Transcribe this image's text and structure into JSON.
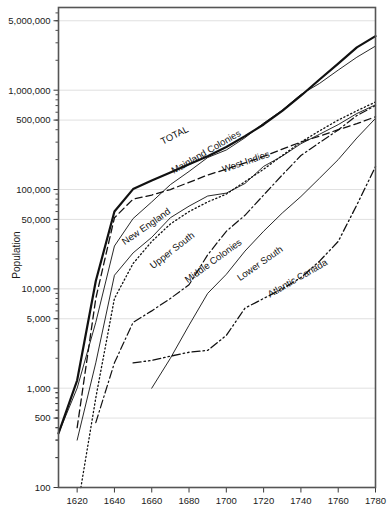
{
  "chart_data": {
    "type": "line",
    "title": "",
    "xlabel": "",
    "ylabel": "Population",
    "yscale": "log",
    "ylim": [
      100,
      6800000
    ],
    "xlim": [
      1610,
      1780
    ],
    "grid": true,
    "legend_position": "inline-labels",
    "y_tick_labels": [
      "5,000,000",
      "1,000,000",
      "500,000",
      "100,000",
      "50,000",
      "10,000",
      "5,000",
      "1,000",
      "500",
      "100"
    ],
    "y_tick_values": [
      5000000,
      1000000,
      500000,
      100000,
      50000,
      10000,
      5000,
      1000,
      500,
      100
    ],
    "x_tick_labels": [
      "1620",
      "1640",
      "1660",
      "1680",
      "1700",
      "1720",
      "1740",
      "1760",
      "1780"
    ],
    "x_tick_values": [
      1620,
      1640,
      1660,
      1680,
      1700,
      1720,
      1740,
      1760,
      1780
    ],
    "series": [
      {
        "name": "TOTAL",
        "style": "solid-thick",
        "label": "TOTAL",
        "label_x": 1673,
        "label_y": 330000,
        "label_rotate": -27,
        "x": [
          1610,
          1620,
          1630,
          1640,
          1650,
          1660,
          1670,
          1680,
          1690,
          1700,
          1710,
          1720,
          1730,
          1740,
          1750,
          1760,
          1770,
          1780
        ],
        "y": [
          350,
          1200,
          12000,
          60000,
          101000,
          123000,
          148000,
          180000,
          216000,
          268000,
          345000,
          452000,
          620000,
          880000,
          1280000,
          1850000,
          2700000,
          3500000
        ]
      },
      {
        "name": "Mainland Colonies",
        "style": "solid-thin",
        "label": "Mainland Colonies",
        "label_x": 1690,
        "label_y": 225000,
        "label_rotate": -30,
        "x": [
          1610,
          1620,
          1630,
          1640,
          1650,
          1660,
          1670,
          1680,
          1690,
          1700,
          1710,
          1720,
          1730,
          1740,
          1750,
          1760,
          1770,
          1780
        ],
        "y": [
          350,
          1000,
          4600,
          27000,
          51000,
          75000,
          112000,
          152000,
          210000,
          250000,
          332000,
          466000,
          629000,
          906000,
          1170000,
          1594000,
          2148000,
          2780000
        ]
      },
      {
        "name": "West Indies",
        "style": "dashed",
        "label": "West Indies",
        "label_x": 1711,
        "label_y": 178000,
        "label_rotate": -19,
        "x": [
          1620,
          1630,
          1640,
          1650,
          1660,
          1670,
          1680,
          1690,
          1700,
          1710,
          1720,
          1730,
          1740,
          1750,
          1760,
          1770,
          1780
        ],
        "y": [
          400,
          8000,
          52000,
          80000,
          88000,
          100000,
          118000,
          140000,
          160000,
          185000,
          215000,
          255000,
          300000,
          345000,
          400000,
          460000,
          540000
        ]
      },
      {
        "name": "New England",
        "style": "solid-thin",
        "label": "New England",
        "label_x": 1658,
        "label_y": 40000,
        "label_rotate": -35,
        "x": [
          1620,
          1630,
          1640,
          1650,
          1660,
          1670,
          1680,
          1690,
          1700,
          1710,
          1720,
          1730,
          1740,
          1750,
          1760,
          1770,
          1780
        ],
        "y": [
          300,
          1800,
          13700,
          23000,
          33000,
          52000,
          68000,
          86000,
          92000,
          115000,
          171000,
          217000,
          289000,
          360000,
          450000,
          582000,
          712000
        ]
      },
      {
        "name": "Upper South",
        "style": "dotted",
        "label": "Upper South",
        "label_x": 1672,
        "label_y": 23000,
        "label_rotate": -38,
        "x": [
          1622,
          1630,
          1640,
          1650,
          1660,
          1670,
          1680,
          1690,
          1700,
          1710,
          1720,
          1730,
          1740,
          1750,
          1760,
          1770,
          1780
        ],
        "y": [
          100,
          800,
          8000,
          18000,
          30000,
          45000,
          60000,
          75000,
          90000,
          120000,
          160000,
          220000,
          300000,
          390000,
          500000,
          620000,
          760000
        ]
      },
      {
        "name": "Middle Colonies",
        "style": "dash-dot",
        "label": "Middle Colonies",
        "label_x": 1694,
        "label_y": 18000,
        "label_rotate": -36,
        "x": [
          1630,
          1640,
          1650,
          1660,
          1670,
          1680,
          1690,
          1700,
          1710,
          1720,
          1730,
          1740,
          1750,
          1760,
          1770,
          1780
        ],
        "y": [
          450,
          1800,
          4600,
          6000,
          8000,
          11000,
          22000,
          38000,
          55000,
          88000,
          140000,
          220000,
          297000,
          398000,
          556000,
          700000
        ]
      },
      {
        "name": "Lower South",
        "style": "solid-thin",
        "label": "Lower South",
        "label_x": 1719,
        "label_y": 17000,
        "label_rotate": -35,
        "x": [
          1660,
          1670,
          1680,
          1690,
          1700,
          1710,
          1720,
          1730,
          1740,
          1750,
          1760,
          1770,
          1780
        ],
        "y": [
          1000,
          2000,
          4300,
          9000,
          14000,
          24000,
          38000,
          58000,
          85000,
          130000,
          200000,
          330000,
          520000
        ]
      },
      {
        "name": "Atlantic Canada",
        "style": "dash-dot-dot",
        "label": "Atlantic Canada",
        "label_x": 1739,
        "label_y": 12000,
        "label_rotate": -30,
        "x": [
          1650,
          1660,
          1670,
          1680,
          1690,
          1700,
          1710,
          1720,
          1730,
          1740,
          1750,
          1760,
          1770,
          1780
        ],
        "y": [
          1800,
          1900,
          2100,
          2300,
          2400,
          3400,
          6400,
          8000,
          10000,
          13000,
          19000,
          30000,
          70000,
          170000
        ]
      }
    ]
  }
}
